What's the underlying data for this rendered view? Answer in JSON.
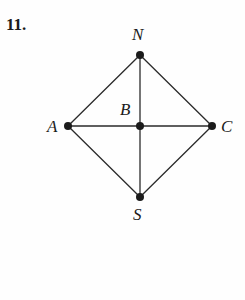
{
  "figure": {
    "problem_number": "11.",
    "background_color": "#fefefe",
    "line_color": "#2b2b2b",
    "vertex_color": "#1b1b1b",
    "label_color": "#1b1b1b",
    "vertex_radius": 4,
    "edge_width": 1.3,
    "vertices": [
      {
        "id": "N",
        "label": "N",
        "x": 140,
        "y": 55,
        "label_x": 140,
        "label_y": 34,
        "label_anchor": "above"
      },
      {
        "id": "A",
        "label": "A",
        "x": 68,
        "y": 126,
        "label_x": 54,
        "label_y": 126,
        "label_anchor": "left"
      },
      {
        "id": "C",
        "label": "C",
        "x": 212,
        "y": 126,
        "label_x": 227,
        "label_y": 126,
        "label_anchor": "right"
      },
      {
        "id": "S",
        "label": "S",
        "x": 140,
        "y": 197,
        "label_x": 140,
        "label_y": 215,
        "label_anchor": "below"
      },
      {
        "id": "B",
        "label": "B",
        "x": 140,
        "y": 126,
        "label_x": 127,
        "label_y": 110,
        "label_anchor": "upper-left"
      }
    ],
    "edges": [
      {
        "from": "N",
        "to": "A",
        "x1": 140,
        "y1": 55,
        "x2": 68,
        "y2": 126
      },
      {
        "from": "A",
        "to": "S",
        "x1": 68,
        "y1": 126,
        "x2": 140,
        "y2": 197
      },
      {
        "from": "S",
        "to": "C",
        "x1": 140,
        "y1": 197,
        "x2": 212,
        "y2": 126
      },
      {
        "from": "C",
        "to": "N",
        "x1": 212,
        "y1": 126,
        "x2": 140,
        "y2": 55
      },
      {
        "from": "A",
        "to": "C",
        "x1": 68,
        "y1": 126,
        "x2": 212,
        "y2": 126
      },
      {
        "from": "N",
        "to": "S",
        "x1": 140,
        "y1": 55,
        "x2": 140,
        "y2": 197
      }
    ]
  }
}
